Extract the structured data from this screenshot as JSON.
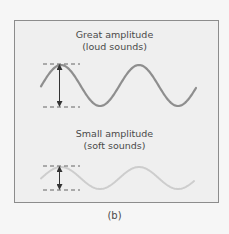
{
  "figure": {
    "label": "(b)",
    "panels": [
      {
        "id": "great",
        "title_line1": "Great amplitude",
        "title_line2": "(loud sounds)",
        "amplitude": "great",
        "wave_color": "#8e8e8e"
      },
      {
        "id": "small",
        "title_line1": "Small amplitude",
        "title_line2": "(soft sounds)",
        "amplitude": "small",
        "wave_color": "#cdcdcd"
      }
    ],
    "guide_color": "#555555",
    "arrow_color": "#333333"
  }
}
